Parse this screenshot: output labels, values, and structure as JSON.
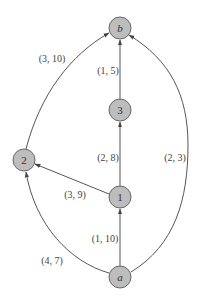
{
  "diagram": {
    "type": "directed-graph",
    "nodes": [
      {
        "id": "b",
        "label": "b",
        "italic": true
      },
      {
        "id": "3",
        "label": "3",
        "italic": false
      },
      {
        "id": "2",
        "label": "2",
        "italic": false
      },
      {
        "id": "1",
        "label": "1",
        "italic": false
      },
      {
        "id": "a",
        "label": "a",
        "italic": true
      }
    ],
    "edges": [
      {
        "from": "2",
        "to": "b",
        "label": "(3, 10)"
      },
      {
        "from": "3",
        "to": "b",
        "label": "(1, 5)"
      },
      {
        "from": "1",
        "to": "3",
        "label": "(2, 8)"
      },
      {
        "from": "1",
        "to": "2",
        "label": "(3, 9)"
      },
      {
        "from": "a",
        "to": "1",
        "label": "(1, 10)"
      },
      {
        "from": "a",
        "to": "2",
        "label": "(4, 7)"
      },
      {
        "from": "a",
        "to": "b",
        "label": "(2, 3)"
      }
    ]
  }
}
